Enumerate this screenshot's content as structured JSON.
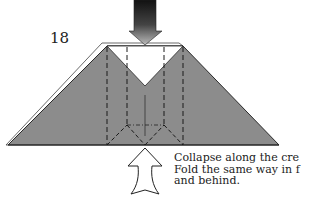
{
  "diagram": {
    "step_number": "18",
    "instructions": [
      "Collapse along the cre",
      "Fold the same way in f",
      "and behind."
    ],
    "colors": {
      "paper_colored": "#8c8c8c",
      "paper_white": "#ffffff",
      "outline": "#333333",
      "crease": "#222222"
    },
    "elements": {
      "push_arrow_top": "push-down arrow (filled, gradient)",
      "push_arrow_bottom": "push-up arrow (hollow outline)",
      "model": "trapezoid base with white inner triangle flap",
      "creases": "valley-fold dashed lines and mountain-fold dash-dot lines"
    }
  }
}
